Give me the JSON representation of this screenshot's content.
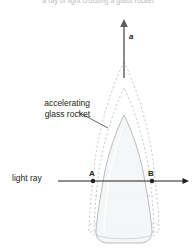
{
  "figure": {
    "width": 196,
    "height": 252,
    "background_color": "#ffffff"
  },
  "caption": {
    "top_text": "a ray of light crossing a glass rocket"
  },
  "labels": {
    "rocket_label_line1": "accelerating",
    "rocket_label_line2": "glass rocket",
    "light_ray_label": "light ray",
    "acceleration_symbol": "a",
    "point_a": "A",
    "point_b": "B"
  },
  "colors": {
    "text": "#231f20",
    "caption": "#b9b9bd",
    "rocket_outline": "#b9bcc0",
    "rocket_fill": "#f4f5f6",
    "ghost_outline": "#c9cbcf",
    "ray_line": "#231f20",
    "leader_line": "#58595b",
    "arrow_shaft": "#6d6e71"
  },
  "geometry": {
    "rocket_solid": {
      "nose_tip_y": 115,
      "base_y": 243,
      "left_x": 86,
      "right_x": 159,
      "shoulder_y": 180
    },
    "ghost_positions": [
      {
        "nose_tip_y": 62,
        "label": "outer-ghost-rocket"
      },
      {
        "nose_tip_y": 88,
        "label": "inner-ghost-rocket"
      }
    ],
    "acceleration_arrow": {
      "x": 124,
      "tail_y": 78,
      "head_y": 21,
      "direction": "up"
    },
    "light_ray": {
      "y": 181,
      "start_x": 58,
      "end_x": 188,
      "direction": "right"
    },
    "point_a": {
      "x": 93,
      "y": 181
    },
    "point_b": {
      "x": 152,
      "y": 181
    },
    "leader_line": {
      "from_x": 77,
      "from_y": 112,
      "to_x": 107,
      "to_y": 128
    }
  }
}
